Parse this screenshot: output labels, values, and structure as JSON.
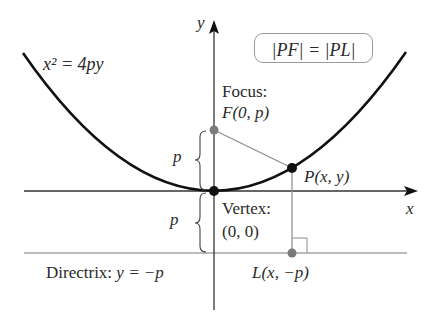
{
  "figure": {
    "equation_label": "x² = 4py",
    "condition_box": "|PF| = |PL|",
    "axes": {
      "x_label": "x",
      "y_label": "y"
    },
    "focus": {
      "title": "Focus:",
      "coords": "F(0, p)"
    },
    "vertex": {
      "title": "Vertex:",
      "coords": "(0, 0)"
    },
    "point_p": "P(x, y)",
    "point_l": "L(x, −p)",
    "directrix": {
      "prefix": "Directrix: ",
      "equation": "y = −p"
    },
    "distance_labels": {
      "upper": "p",
      "lower": "p"
    },
    "colors": {
      "curve": "#111111",
      "axes": "#333333",
      "guide_lines": "#8c8c8c",
      "focus_point": "#7a7a7a",
      "vertex_point": "#111111",
      "l_point": "#7a7a7a"
    }
  }
}
